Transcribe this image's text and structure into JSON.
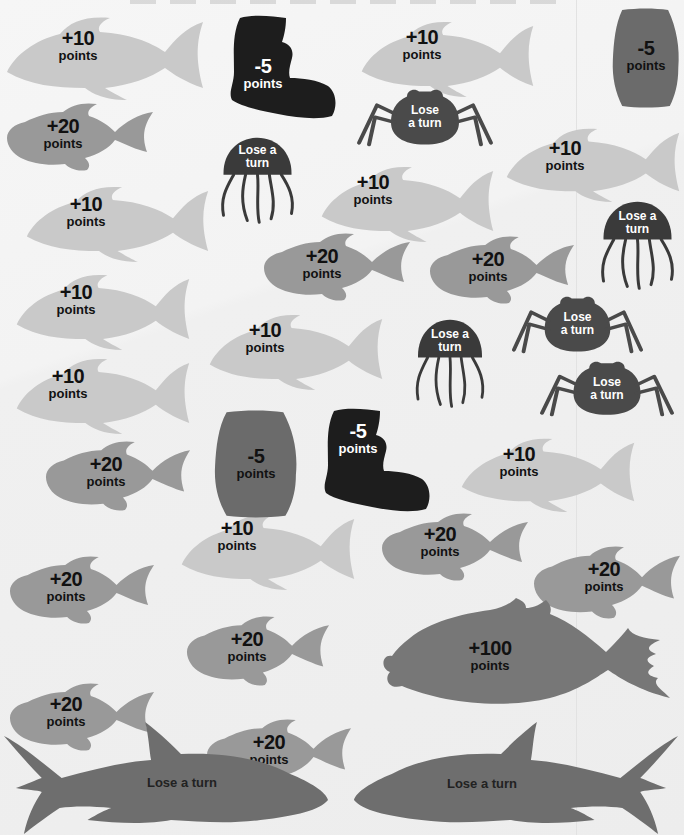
{
  "board": {
    "title_partial": "",
    "colors": {
      "background": "#f2f2f2",
      "light_fish": "#c9c9c9",
      "medium_fish": "#999999",
      "big_fish": "#777777",
      "shark": "#6e6e6e",
      "barrel": "#6b6b6b",
      "boot": "#1d1d1d",
      "jellyfish": "#3a3a3a",
      "crab": "#4a4a4a"
    }
  },
  "pieces": {
    "light_fish": [
      {
        "value": "+10",
        "unit": "points"
      },
      {
        "value": "+10",
        "unit": "points"
      },
      {
        "value": "+10",
        "unit": "points"
      },
      {
        "value": "+10",
        "unit": "points"
      },
      {
        "value": "+10",
        "unit": "points"
      },
      {
        "value": "+10",
        "unit": "points"
      },
      {
        "value": "+10",
        "unit": "points"
      },
      {
        "value": "+10",
        "unit": "points"
      },
      {
        "value": "+10",
        "unit": "points"
      },
      {
        "value": "+10",
        "unit": "points"
      }
    ],
    "medium_fish": [
      {
        "value": "+20",
        "unit": "points"
      },
      {
        "value": "+20",
        "unit": "points"
      },
      {
        "value": "+20",
        "unit": "points"
      },
      {
        "value": "+20",
        "unit": "points"
      },
      {
        "value": "+20",
        "unit": "points"
      },
      {
        "value": "+20",
        "unit": "points"
      },
      {
        "value": "+20",
        "unit": "points"
      },
      {
        "value": "+20",
        "unit": "points"
      },
      {
        "value": "+20",
        "unit": "points"
      },
      {
        "value": "+20",
        "unit": "points"
      }
    ],
    "boots": [
      {
        "value": "-5",
        "unit": "points"
      },
      {
        "value": "-5",
        "unit": "points"
      }
    ],
    "barrels": [
      {
        "value": "-5",
        "unit": "points"
      },
      {
        "value": "-5",
        "unit": "points"
      }
    ],
    "jellyfish": [
      {
        "line1": "Lose a",
        "line2": "turn"
      },
      {
        "line1": "Lose a",
        "line2": "turn"
      },
      {
        "line1": "Lose a",
        "line2": "turn"
      }
    ],
    "crabs": [
      {
        "line1": "Lose",
        "line2": "a turn"
      },
      {
        "line1": "Lose",
        "line2": "a turn"
      },
      {
        "line1": "Lose",
        "line2": "a turn"
      }
    ],
    "big_fish": {
      "value": "+100",
      "unit": "points"
    },
    "sharks": [
      {
        "label": "Lose a turn"
      },
      {
        "label": "Lose a turn"
      }
    ]
  }
}
